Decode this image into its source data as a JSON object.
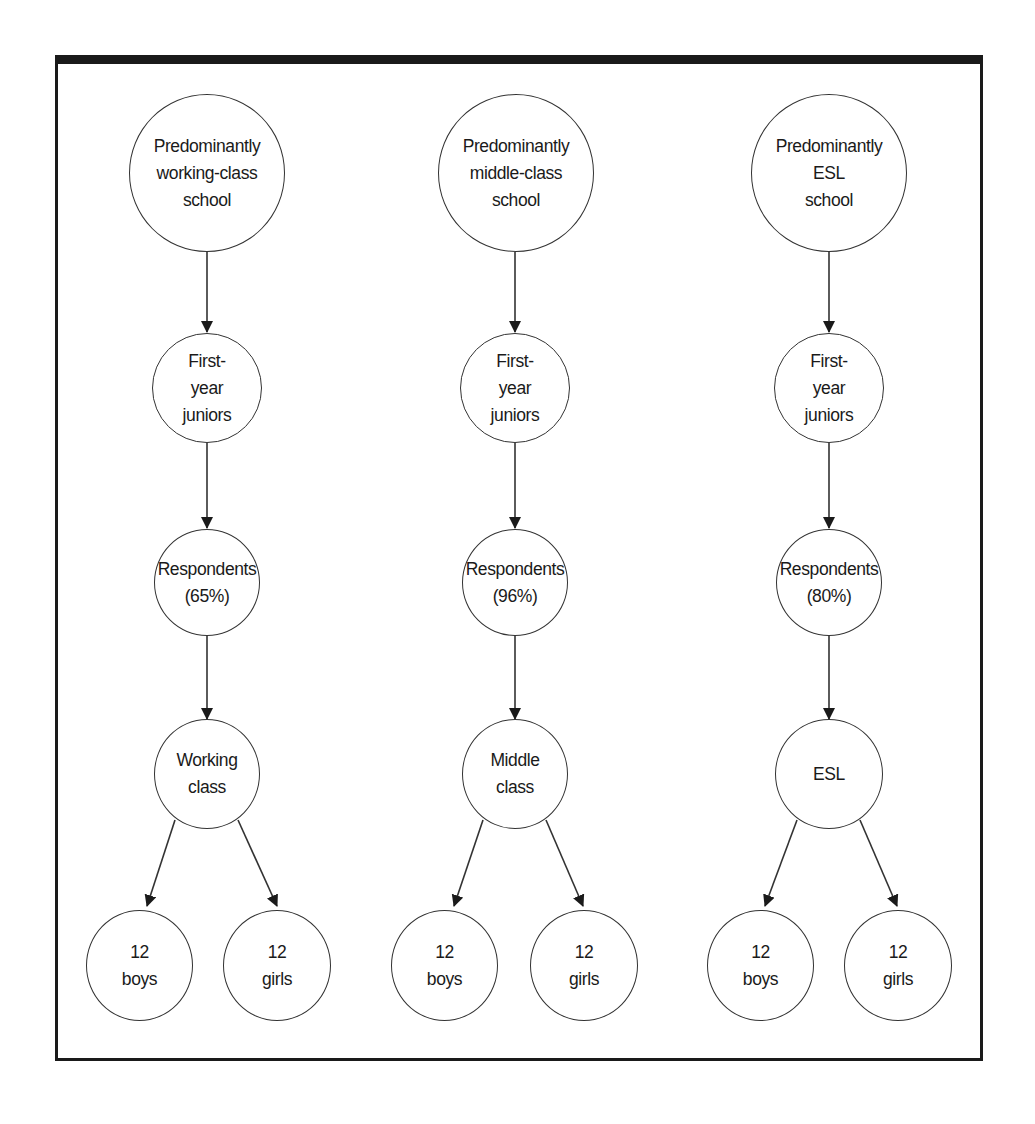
{
  "diagram": {
    "type": "flowchart",
    "columns": [
      {
        "school": "Predominantly\nworking-class\nschool",
        "cohort": "First-\nyear\njuniors",
        "respondents": "Respondents\n(65%)",
        "group": "Working\nclass",
        "children": [
          "12\nboys",
          "12\ngirls"
        ]
      },
      {
        "school": "Predominantly\nmiddle-class\nschool",
        "cohort": "First-\nyear\njuniors",
        "respondents": "Respondents\n(96%)",
        "group": "Middle\nclass",
        "children": [
          "12\nboys",
          "12\ngirls"
        ]
      },
      {
        "school": "Predominantly\nESL\nschool",
        "cohort": "First-\nyear\njuniors",
        "respondents": "Respondents\n(80%)",
        "group": "ESL",
        "children": [
          "12\nboys",
          "12\ngirls"
        ]
      }
    ],
    "colors": {
      "frame": "#1a1a1a",
      "stroke": "#333333",
      "text": "#1a1a1a",
      "background": "#ffffff"
    }
  }
}
